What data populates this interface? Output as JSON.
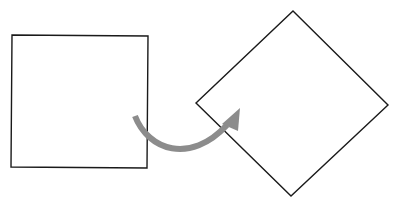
{
  "diagram": {
    "background": "#ffffff",
    "stroke_color": "#1a1a1a",
    "arrow_color": "#8c8c8c",
    "original_square": {
      "points": "12,35 148,36 147,168 11,167"
    },
    "rotated_square": {
      "points": "293,11 388,105 291,196 196,103"
    },
    "rotation_arrow": {
      "path": "M135,116 C148,150 190,165 227,125",
      "head": "240,108 222,124 238,131"
    }
  }
}
